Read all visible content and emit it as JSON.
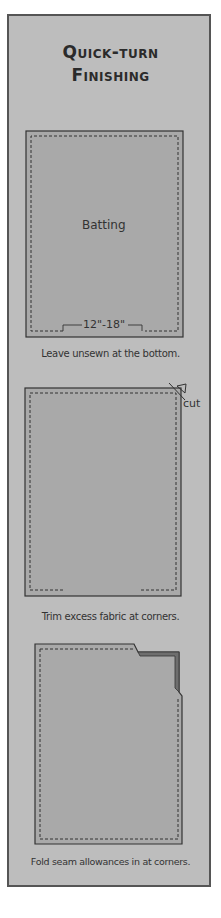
{
  "title": {
    "line1": "Quick-turn",
    "line2": "Finishing"
  },
  "steps": [
    {
      "diagram_label": "Batting",
      "measurement": "12\"-18\"",
      "caption": "Leave unsewn at the bottom."
    },
    {
      "annotation": "cut",
      "caption": "Trim excess fabric at corners."
    },
    {
      "caption": "Fold seam allowances in at corners."
    }
  ],
  "colors": {
    "panel": "#bdbdbd",
    "panel_border": "#555555",
    "fabric": "#a9a9a9",
    "fold": "#6e6e6e",
    "line": "#333333"
  }
}
